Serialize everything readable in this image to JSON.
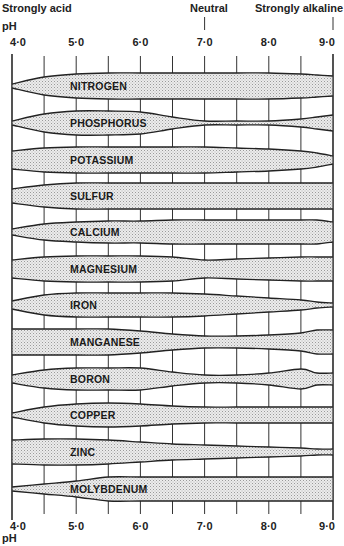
{
  "chart_data": {
    "type": "area",
    "top_labels": {
      "left": "Strongly acid",
      "center": "Neutral",
      "right": "Strongly alkaline",
      "axis_unit": "pH"
    },
    "xlabel": "pH",
    "xlim": [
      4.0,
      9.0
    ],
    "x_ticks": [
      "4·0",
      "5·0",
      "6·0",
      "7·0",
      "8·0",
      "9·0"
    ],
    "x_tick_values": [
      4.0,
      5.0,
      6.0,
      7.0,
      8.0,
      9.0
    ],
    "minor_tick_step": 0.5,
    "ph_samples": [
      4.0,
      4.5,
      5.0,
      5.5,
      6.0,
      6.5,
      7.0,
      7.5,
      8.0,
      8.5,
      8.75,
      9.0
    ],
    "series": [
      {
        "name": "NITROGEN",
        "half_width": [
          2,
          9,
          12,
          13,
          13,
          13,
          13,
          13,
          13,
          12,
          11,
          10
        ]
      },
      {
        "name": "PHOSPHORUS",
        "half_width": [
          2,
          9,
          12,
          12,
          11,
          6,
          2,
          2,
          2,
          4,
          6,
          8
        ]
      },
      {
        "name": "POTASSIUM",
        "half_width": [
          9,
          12,
          13,
          13,
          13,
          13,
          13,
          12,
          11,
          9,
          7,
          4
        ]
      },
      {
        "name": "SULFUR",
        "half_width": [
          7,
          11,
          13,
          13,
          13,
          13,
          13,
          13,
          13,
          13,
          13,
          13
        ]
      },
      {
        "name": "CALCIUM",
        "half_width": [
          3,
          8,
          10,
          11,
          11,
          12,
          12,
          12,
          12,
          12,
          12,
          10
        ]
      },
      {
        "name": "MAGNESIUM",
        "half_width": [
          9,
          12,
          13,
          13,
          13,
          12,
          9,
          10,
          11,
          12,
          12,
          12
        ]
      },
      {
        "name": "IRON",
        "half_width": [
          4,
          10,
          12,
          12,
          12,
          12,
          11,
          9,
          7,
          5,
          3,
          2
        ]
      },
      {
        "name": "MANGANESE",
        "half_width": [
          13,
          13,
          13,
          13,
          11,
          8,
          6,
          6,
          7,
          9,
          12,
          12
        ]
      },
      {
        "name": "BORON",
        "half_width": [
          4,
          9,
          11,
          11,
          11,
          7,
          4,
          4,
          6,
          10,
          6,
          6
        ]
      },
      {
        "name": "COPPER",
        "half_width": [
          2,
          8,
          11,
          12,
          11,
          9,
          8,
          8,
          8,
          8,
          8,
          8
        ]
      },
      {
        "name": "ZINC",
        "half_width": [
          12,
          13,
          13,
          12,
          10,
          8,
          7,
          6,
          5,
          4,
          3,
          3
        ]
      },
      {
        "name": "MOLYBDENUM",
        "half_width": [
          2,
          5,
          8,
          12,
          12,
          12,
          12,
          12,
          12,
          12,
          12,
          12
        ]
      }
    ],
    "grid": false,
    "legend": "none",
    "fill_pattern": "stippled"
  }
}
